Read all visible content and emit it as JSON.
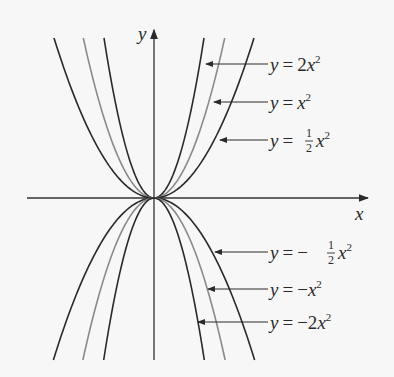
{
  "figure": {
    "background": "#f7f7f7",
    "axis_color": "#333333",
    "axes": {
      "x_label": "x",
      "y_label": "y"
    },
    "curves": [
      {
        "name": "y = 2x^2",
        "coef": 2,
        "color": "#2a2a2a"
      },
      {
        "name": "y = x^2",
        "coef": 1,
        "color": "#8a8a8a"
      },
      {
        "name": "y = 1/2 x^2",
        "coef": 0.5,
        "color": "#2a2a2a"
      },
      {
        "name": "y = -1/2 x^2",
        "coef": -0.5,
        "color": "#2a2a2a"
      },
      {
        "name": "y = -x^2",
        "coef": -1,
        "color": "#8a8a8a"
      },
      {
        "name": "y = -2x^2",
        "coef": -2,
        "color": "#2a2a2a"
      }
    ],
    "labels": {
      "l1": {
        "y": "y",
        "eq": "=",
        "pre": "2",
        "var": "x",
        "exp": "2"
      },
      "l2": {
        "y": "y",
        "eq": "=",
        "pre": "",
        "var": "x",
        "exp": "2"
      },
      "l3": {
        "y": "y",
        "eq": "=",
        "num": "1",
        "den": "2",
        "var": "x",
        "exp": "2"
      },
      "l4": {
        "y": "y",
        "eq": "=",
        "sign": "−",
        "num": "1",
        "den": "2",
        "var": "x",
        "exp": "2"
      },
      "l5": {
        "y": "y",
        "eq": "=",
        "pre": "−",
        "var": "x",
        "exp": "2"
      },
      "l6": {
        "y": "y",
        "eq": "=",
        "pre": "−2",
        "var": "x",
        "exp": "2"
      }
    }
  }
}
